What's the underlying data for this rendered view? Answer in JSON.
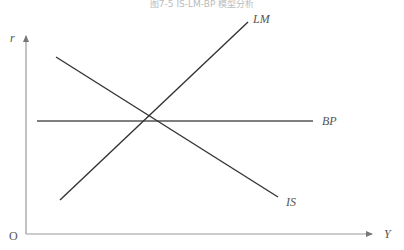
{
  "title": "图7-5 IS-LM-BP 模型分析",
  "axes": {
    "y_label": "r",
    "x_label": "Y",
    "origin_label": "O"
  },
  "curves": {
    "lm": {
      "label": "LM",
      "x1": 60,
      "y1": 200,
      "x2": 248,
      "y2": 22
    },
    "is": {
      "label": "IS",
      "x1": 56,
      "y1": 57,
      "x2": 278,
      "y2": 197
    },
    "bp": {
      "label": "BP",
      "x1": 37,
      "y1": 121,
      "x2": 313,
      "y2": 121
    }
  },
  "colors": {
    "axis": "#999999",
    "line": "#333333",
    "label": "#555555"
  }
}
